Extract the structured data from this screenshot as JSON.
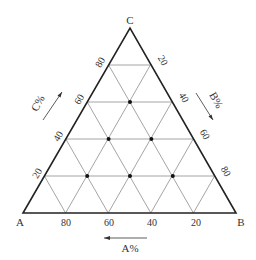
{
  "diagram": {
    "type": "ternary",
    "vertices": {
      "A": {
        "label": "A"
      },
      "B": {
        "label": "B"
      },
      "C": {
        "label": "C"
      }
    },
    "axes": {
      "bottom": {
        "title": "A%",
        "ticks": [
          "80",
          "60",
          "40",
          "20"
        ],
        "arrow": "left"
      },
      "left": {
        "title": "C%",
        "ticks": [
          "20",
          "40",
          "60",
          "80"
        ],
        "arrow": "up-right"
      },
      "right": {
        "title": "B%",
        "ticks": [
          "20",
          "40",
          "60",
          "80"
        ],
        "arrow": "down-right"
      }
    },
    "grid_step_percent": 20,
    "points": [
      {
        "A": 20,
        "B": 20,
        "C": 60
      },
      {
        "A": 40,
        "B": 20,
        "C": 40
      },
      {
        "A": 20,
        "B": 40,
        "C": 40
      },
      {
        "A": 60,
        "B": 20,
        "C": 20
      },
      {
        "A": 40,
        "B": 40,
        "C": 20
      },
      {
        "A": 20,
        "B": 60,
        "C": 20
      }
    ],
    "colors": {
      "outline": "#222222",
      "grid": "#9a9a9a",
      "points": "#111111",
      "text": "#333333"
    }
  }
}
